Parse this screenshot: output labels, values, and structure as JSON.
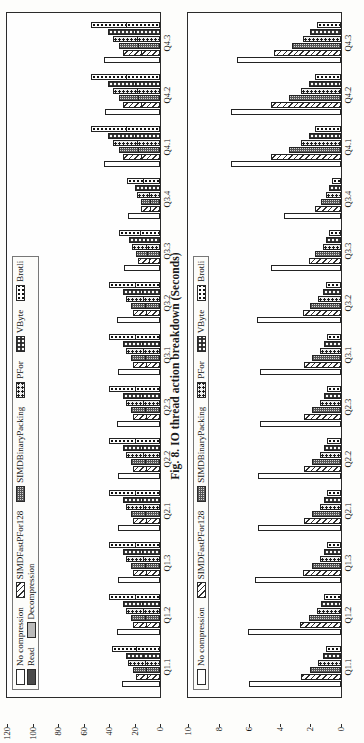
{
  "figure": {
    "caption": "Fig. 8. IO thread action breakdown (Seconds)"
  },
  "charts": [
    {
      "id": "top-panel",
      "name": "io-thread-action-breakdown-total",
      "legend_rows": [
        [
          {
            "label": "No compression",
            "pattern": "p-none"
          },
          {
            "label": "SIMDFastPFor128",
            "pattern": "p-simdfastpfor"
          },
          {
            "label": "SIMDBinaryPacking",
            "pattern": "p-simdbinary"
          },
          {
            "label": "PFor",
            "pattern": "p-pfor"
          },
          {
            "label": "VByte",
            "pattern": "p-vbyte"
          },
          {
            "label": "Brotli",
            "pattern": "p-brotli"
          }
        ],
        [
          {
            "label": "Read",
            "pattern": "sw-read"
          },
          {
            "label": "Decompression",
            "pattern": "sw-decomp"
          }
        ]
      ],
      "yticks": [
        0,
        20,
        40,
        60,
        80,
        100,
        120
      ]
    },
    {
      "id": "bottom-panel",
      "name": "io-thread-action-breakdown-detail",
      "legend_rows": [
        [
          {
            "label": "No compression",
            "pattern": "p-none"
          },
          {
            "label": "SIMDFastPFor128",
            "pattern": "p-simdfastpfor"
          },
          {
            "label": "SIMDBinaryPacking",
            "pattern": "p-simdbinary"
          },
          {
            "label": "PFor",
            "pattern": "p-pfor"
          },
          {
            "label": "VByte",
            "pattern": "p-vbyte"
          },
          {
            "label": "Brotli",
            "pattern": "p-brotli"
          }
        ]
      ],
      "yticks": [
        0,
        2,
        4,
        6,
        8,
        10
      ]
    }
  ],
  "chart_data": [
    {
      "type": "bar",
      "id": "top-panel",
      "title": "",
      "subtitle": "",
      "xlabel": "",
      "ylabel": "Seconds",
      "ylim": [
        0,
        120
      ],
      "yticks": [
        0,
        20,
        40,
        60,
        80,
        100,
        120
      ],
      "grid": false,
      "stacked": true,
      "legend_position": "top-left",
      "legend": [
        "No compression",
        "SIMDFastPFor128",
        "SIMDBinaryPacking",
        "PFor",
        "VByte",
        "Brotli",
        "Read",
        "Decompression"
      ],
      "categories": [
        "Q1.1",
        "Q1.2",
        "Q1.3",
        "Q2.1",
        "Q2.2",
        "Q2.3",
        "Q3.1",
        "Q3.2",
        "Q3.3",
        "Q3.4",
        "Q4.1",
        "Q4.2",
        "Q4.3"
      ],
      "series": [
        {
          "name": "No compression",
          "pattern": "p-none",
          "read": [
            30,
            34,
            33,
            33,
            33,
            34,
            33,
            34,
            28,
            25,
            44,
            43,
            44
          ],
          "decomp": [
            0,
            0,
            0,
            0,
            0,
            0,
            0,
            0,
            0,
            0,
            0,
            0,
            0
          ]
        },
        {
          "name": "SIMDFastPFor128",
          "pattern": "p-simdfastpfor",
          "read": [
            10,
            11,
            11,
            11,
            11,
            11,
            11,
            11,
            9,
            8,
            15,
            15,
            15
          ],
          "decomp": [
            9,
            10,
            10,
            10,
            10,
            10,
            10,
            10,
            8,
            7,
            14,
            14,
            14
          ]
        },
        {
          "name": "SIMDBinaryPacking",
          "pattern": "p-simdbinary",
          "read": [
            11,
            12,
            12,
            12,
            12,
            12,
            12,
            12,
            10,
            8,
            17,
            17,
            17
          ],
          "decomp": [
            10,
            11,
            11,
            11,
            11,
            11,
            11,
            11,
            9,
            7,
            15,
            15,
            15
          ]
        },
        {
          "name": "PFor",
          "pattern": "p-pfor",
          "read": [
            12,
            13,
            13,
            13,
            13,
            13,
            13,
            13,
            11,
            9,
            18,
            18,
            18
          ],
          "decomp": [
            13,
            14,
            14,
            14,
            14,
            14,
            14,
            14,
            11,
            9,
            19,
            19,
            19
          ]
        },
        {
          "name": "VByte",
          "pattern": "p-vbyte",
          "read": [
            13,
            14,
            14,
            14,
            14,
            14,
            14,
            14,
            12,
            10,
            20,
            20,
            20
          ],
          "decomp": [
            14,
            15,
            15,
            15,
            15,
            15,
            15,
            15,
            12,
            10,
            21,
            21,
            21
          ]
        },
        {
          "name": "Brotli",
          "pattern": "p-brotli",
          "read": [
            19,
            20,
            20,
            20,
            20,
            20,
            20,
            20,
            16,
            13,
            27,
            27,
            27
          ],
          "decomp": [
            19,
            20,
            20,
            20,
            20,
            20,
            20,
            20,
            16,
            13,
            27,
            27,
            27
          ]
        }
      ]
    },
    {
      "type": "bar",
      "id": "bottom-panel",
      "title": "",
      "subtitle": "",
      "xlabel": "",
      "ylabel": "Seconds",
      "ylim": [
        0,
        10
      ],
      "yticks": [
        0,
        2,
        4,
        6,
        8,
        10
      ],
      "grid": false,
      "stacked": false,
      "legend_position": "top-left",
      "legend": [
        "No compression",
        "SIMDFastPFor128",
        "SIMDBinaryPacking",
        "PFor",
        "VByte",
        "Brotli"
      ],
      "categories": [
        "Q1.1",
        "Q1.2",
        "Q1.3",
        "Q2.1",
        "Q2.2",
        "Q2.3",
        "Q3.1",
        "Q3.2",
        "Q3.3",
        "Q3.4",
        "Q4.1",
        "Q4.2",
        "Q4.3"
      ],
      "series": [
        {
          "name": "No compression",
          "pattern": "p-none",
          "values": [
            6.0,
            6.1,
            5.6,
            5.4,
            5.4,
            5.3,
            5.3,
            5.5,
            4.6,
            3.7,
            7.2,
            7.2,
            6.8
          ]
        },
        {
          "name": "SIMDFastPFor128",
          "pattern": "p-simdfastpfor",
          "values": [
            2.6,
            2.7,
            2.5,
            2.4,
            2.4,
            2.4,
            2.4,
            2.5,
            2.1,
            1.7,
            4.6,
            4.6,
            4.4
          ]
        },
        {
          "name": "SIMDBinaryPacking",
          "pattern": "p-simdbinary",
          "values": [
            2.0,
            2.1,
            1.9,
            1.9,
            1.9,
            1.9,
            1.9,
            2.0,
            1.7,
            1.3,
            3.4,
            3.4,
            3.2
          ]
        },
        {
          "name": "PFor",
          "pattern": "p-pfor",
          "values": [
            1.5,
            1.6,
            1.4,
            1.4,
            1.4,
            1.4,
            1.4,
            1.5,
            1.2,
            1.0,
            2.6,
            2.6,
            2.5
          ]
        },
        {
          "name": "VByte",
          "pattern": "p-vbyte",
          "values": [
            1.2,
            1.3,
            1.1,
            1.1,
            1.1,
            1.1,
            1.1,
            1.2,
            1.0,
            0.8,
            2.1,
            2.1,
            2.0
          ]
        },
        {
          "name": "Brotli",
          "pattern": "p-brotli",
          "values": [
            1.0,
            1.1,
            0.9,
            0.9,
            0.9,
            0.9,
            0.9,
            1.0,
            0.8,
            0.6,
            1.7,
            1.7,
            1.6
          ]
        }
      ]
    }
  ]
}
